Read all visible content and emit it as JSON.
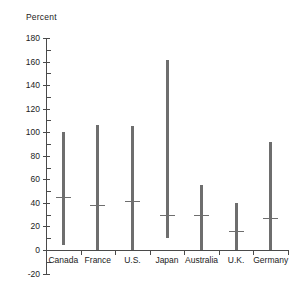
{
  "chart_data": {
    "type": "bar",
    "subtype": "range-bar-with-median",
    "title": "",
    "ylabel": "Percent",
    "xlabel": "",
    "ylim": [
      -20,
      180
    ],
    "y_major_ticks": [
      -20,
      0,
      20,
      40,
      60,
      80,
      100,
      120,
      140,
      160,
      180
    ],
    "y_minor_tick_step": 10,
    "grid": false,
    "legend": null,
    "categories": [
      "Canada",
      "France",
      "U.S.",
      "Japan",
      "Australia",
      "U.K.",
      "Germany"
    ],
    "series": [
      {
        "name": "High",
        "values": [
          100,
          106,
          105,
          161,
          55,
          40,
          92
        ]
      },
      {
        "name": "Low",
        "values": [
          4,
          0,
          0,
          10,
          0,
          0,
          0
        ]
      },
      {
        "name": "Median",
        "values": [
          45,
          38,
          42,
          30,
          30,
          16,
          27
        ]
      }
    ],
    "points": [
      {
        "category": "Canada",
        "low": 4,
        "high": 100,
        "median": 45
      },
      {
        "category": "France",
        "low": 0,
        "high": 106,
        "median": 38
      },
      {
        "category": "U.S.",
        "low": 0,
        "high": 105,
        "median": 42
      },
      {
        "category": "Japan",
        "low": 10,
        "high": 161,
        "median": 30
      },
      {
        "category": "Australia",
        "low": 0,
        "high": 55,
        "median": 30
      },
      {
        "category": "U.K.",
        "low": 0,
        "high": 40,
        "median": 16
      },
      {
        "category": "Germany",
        "low": 0,
        "high": 92,
        "median": 27
      }
    ],
    "colors": {
      "bar": "#6e6e6e",
      "axis": "#4a4a4a",
      "text": "#222222",
      "background": "#ffffff"
    }
  },
  "axis": {
    "y_title": "Percent",
    "tick_labels": [
      "180",
      "160",
      "140",
      "120",
      "100",
      "80",
      "60",
      "40",
      "20",
      "0",
      "-20"
    ]
  }
}
